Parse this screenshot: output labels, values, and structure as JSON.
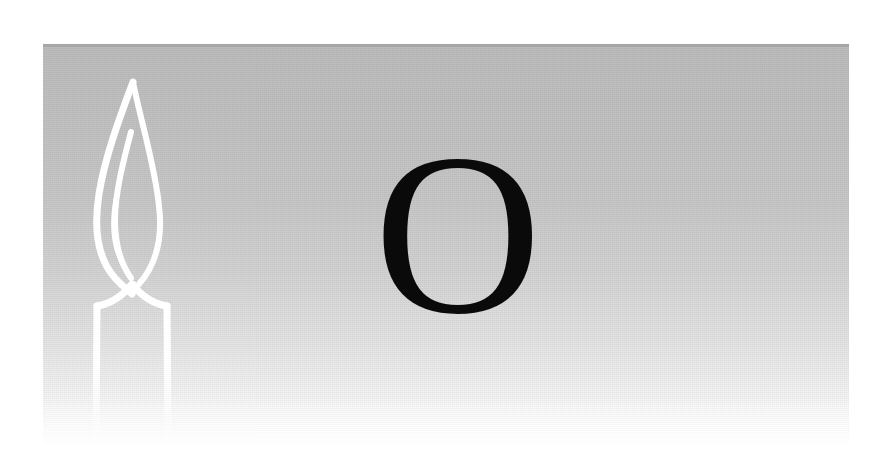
{
  "page": {
    "kind": "scanned-illustration-plate",
    "background_color": "#ffffff",
    "width": 878,
    "height": 466
  },
  "plate": {
    "name": "gradient-panel",
    "left": 43,
    "top": 44,
    "width": 806,
    "height": 400,
    "gradient_from": "#bcbcbc",
    "gradient_to": "#ffffff",
    "gradient_direction": "top-to-bottom"
  },
  "illustration": {
    "subject": "lit candle",
    "style": "white outline line-art on gray ground",
    "stroke_color": "#ffffff",
    "parts": [
      {
        "label": "flame",
        "name": "candle-flame"
      },
      {
        "label": "flame inner highlight",
        "name": "candle-flame-inner"
      },
      {
        "label": "wick",
        "name": "candle-wick"
      },
      {
        "label": "candle body",
        "name": "candle-body"
      }
    ],
    "bounds": {
      "left": 92,
      "top": 80,
      "width": 74,
      "height": 360
    }
  },
  "letter": {
    "glyph": "O",
    "name": "letter-o",
    "color": "#0a0a0a",
    "style": "serif capital",
    "left": 388,
    "top": 160,
    "width": 100,
    "height": 148
  }
}
